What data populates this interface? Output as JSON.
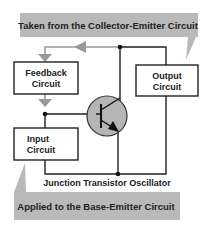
{
  "diagram": {
    "title": "Junction Transistor Oscillator",
    "top_banner": "Taken from the Collector-Emitter Circuit",
    "bottom_banner": "Applied to the Base-Emitter Circuit",
    "boxes": {
      "feedback": [
        "Feedback",
        "Circuit"
      ],
      "output": [
        "Output",
        "Circuit"
      ],
      "input": [
        "Input",
        "Circuit"
      ]
    },
    "component": "transistor-npn"
  },
  "colors": {
    "banner": "#b9b9b9",
    "arrow": "#999999",
    "line": "#222222",
    "transistor_fill": "#b5b5b5"
  }
}
